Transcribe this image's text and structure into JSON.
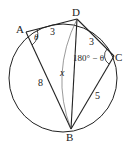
{
  "diagram": {
    "type": "inscribed-quadrilateral",
    "top_fragment_text": "",
    "points": {
      "A": {
        "label": "A"
      },
      "B": {
        "label": "B"
      },
      "C": {
        "label": "C"
      },
      "D": {
        "label": "D"
      }
    },
    "segments": {
      "AD": {
        "label": "3"
      },
      "DC": {
        "label": "3"
      },
      "CB": {
        "label": "5"
      },
      "AB": {
        "label": "8"
      },
      "DB": {
        "label": "x"
      }
    },
    "angles": {
      "A": {
        "label": "θ"
      },
      "C": {
        "label": "180° − θ"
      }
    },
    "colors": {
      "stroke": "#222222",
      "thin_arc": "#555555",
      "background": "#ffffff"
    }
  }
}
